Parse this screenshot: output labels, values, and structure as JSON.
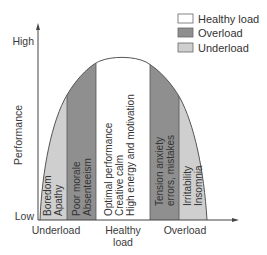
{
  "colors": {
    "healthy": "#ffffff",
    "overload": "#8f8f8f",
    "underload": "#cfcfcf",
    "axis": "#444444",
    "curve": "#555555"
  },
  "legend": {
    "items": [
      {
        "label": "Healthy load",
        "key": "healthy"
      },
      {
        "label": "Overload",
        "key": "overload"
      },
      {
        "label": "Underload",
        "key": "underload"
      }
    ]
  },
  "y_axis": {
    "title": "Performance",
    "high_label": "High",
    "low_label": "Low"
  },
  "x_axis": {
    "labels": {
      "underload": "Underload",
      "healthy_line1": "Healthy",
      "healthy_line2": "load",
      "overload": "Overload"
    }
  },
  "bands": [
    {
      "key": "underload",
      "line1": "Boredom",
      "line2": "Apathy"
    },
    {
      "key": "overload",
      "line1": "Poor morale",
      "line2": "Absenteeism"
    },
    {
      "key": "healthy",
      "line1": "Optimal performance",
      "line2": "Creative calm",
      "line3": "High energy and motivation"
    },
    {
      "key": "overload",
      "line1": "Tension anxiety",
      "line2": "errors, mistakes"
    },
    {
      "key": "underload",
      "line1": "Irritability",
      "line2": "Insomnia"
    }
  ]
}
